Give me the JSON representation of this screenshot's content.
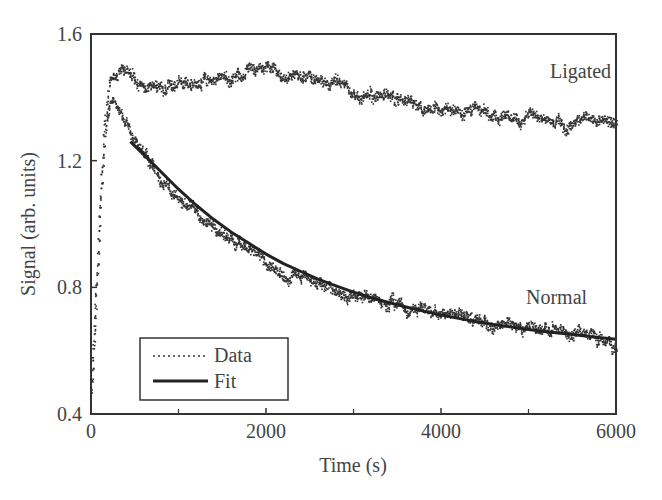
{
  "chart_data": {
    "type": "line",
    "title": "",
    "xlabel": "Time (s)",
    "ylabel": "Signal (arb. units)",
    "xlim": [
      0,
      6000
    ],
    "ylim": [
      0.4,
      1.6
    ],
    "xticks": [
      0,
      2000,
      4000,
      6000
    ],
    "xtick_labels": [
      "0",
      "2000",
      "4000",
      "6000"
    ],
    "x_minor_ticks": [
      1000,
      3000,
      5000
    ],
    "yticks": [
      0.4,
      0.8,
      1.2,
      1.6
    ],
    "ytick_labels": [
      "0.4",
      "0.8",
      "1.2",
      "1.6"
    ],
    "grid": false,
    "legend": {
      "position": "lower left",
      "entries": [
        {
          "label": "Data",
          "style": "dotted"
        },
        {
          "label": "Fit",
          "style": "solid"
        }
      ]
    },
    "annotations": [
      {
        "text": "Ligated",
        "x": 5150,
        "y": 1.52
      },
      {
        "text": "Normal",
        "x": 5000,
        "y": 0.85
      }
    ],
    "series": [
      {
        "name": "Ligated (Data)",
        "style": "dotted",
        "x": [
          0,
          50,
          100,
          150,
          200,
          250,
          300,
          400,
          500,
          600,
          700,
          800,
          900,
          1000,
          1100,
          1200,
          1300,
          1400,
          1500,
          1600,
          1700,
          1800,
          1900,
          2000,
          2100,
          2200,
          2300,
          2400,
          2500,
          2600,
          2700,
          2800,
          2900,
          3000,
          3200,
          3400,
          3600,
          3800,
          4000,
          4200,
          4400,
          4600,
          4800,
          5000,
          5200,
          5400,
          5600,
          5800,
          6000
        ],
        "y": [
          0.48,
          0.75,
          1.05,
          1.3,
          1.44,
          1.48,
          1.49,
          1.47,
          1.45,
          1.44,
          1.43,
          1.42,
          1.44,
          1.45,
          1.44,
          1.43,
          1.46,
          1.47,
          1.46,
          1.45,
          1.47,
          1.49,
          1.48,
          1.5,
          1.49,
          1.46,
          1.47,
          1.48,
          1.46,
          1.44,
          1.45,
          1.44,
          1.43,
          1.42,
          1.41,
          1.4,
          1.4,
          1.37,
          1.36,
          1.35,
          1.36,
          1.34,
          1.33,
          1.34,
          1.33,
          1.32,
          1.34,
          1.33,
          1.32
        ]
      },
      {
        "name": "Normal (Data)",
        "style": "dotted",
        "x": [
          0,
          50,
          100,
          150,
          200,
          250,
          300,
          400,
          500,
          600,
          800,
          1000,
          1200,
          1400,
          1600,
          1800,
          2000,
          2200,
          2400,
          2600,
          2800,
          3000,
          3200,
          3400,
          3600,
          3800,
          4000,
          4200,
          4400,
          4600,
          4800,
          5000,
          5200,
          5400,
          5600,
          5800,
          6000
        ],
        "y": [
          0.48,
          0.75,
          1.05,
          1.28,
          1.38,
          1.4,
          1.37,
          1.32,
          1.27,
          1.22,
          1.15,
          1.08,
          1.03,
          0.98,
          0.96,
          0.91,
          0.88,
          0.85,
          0.83,
          0.81,
          0.79,
          0.78,
          0.77,
          0.76,
          0.74,
          0.73,
          0.72,
          0.71,
          0.7,
          0.69,
          0.68,
          0.68,
          0.67,
          0.66,
          0.65,
          0.64,
          0.61
        ]
      },
      {
        "name": "Normal (Fit)",
        "style": "solid",
        "x": [
          450,
          600,
          800,
          1000,
          1200,
          1400,
          1600,
          1800,
          2000,
          2200,
          2400,
          2600,
          2800,
          3000,
          3200,
          3400,
          3600,
          3800,
          4000,
          4200,
          4400,
          4600,
          4800,
          5000,
          5200,
          5400,
          5600,
          5800,
          6000
        ],
        "y": [
          1.26,
          1.22,
          1.165,
          1.11,
          1.06,
          1.015,
          0.975,
          0.94,
          0.905,
          0.875,
          0.85,
          0.825,
          0.805,
          0.785,
          0.767,
          0.752,
          0.738,
          0.725,
          0.713,
          0.702,
          0.692,
          0.683,
          0.675,
          0.667,
          0.66,
          0.654,
          0.648,
          0.642,
          0.636
        ]
      }
    ]
  }
}
